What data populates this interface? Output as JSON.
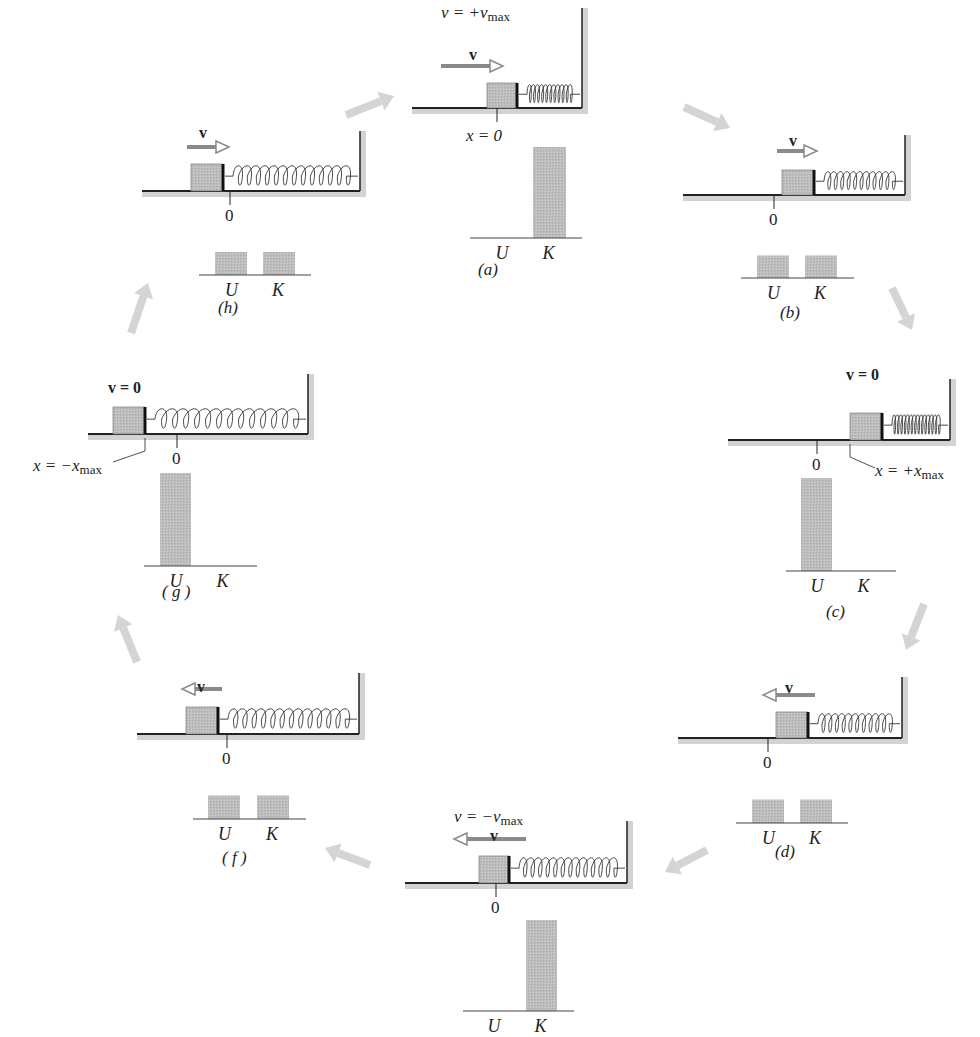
{
  "figure": {
    "colors": {
      "bar": "#b9b9b9",
      "floor": "#d2d2d2",
      "ink": "#222222",
      "cycle_arrow": "#d4d4d4",
      "block": "#c4c4c4",
      "v_arrow": "#8a8a8a"
    }
  },
  "panels": [
    {
      "id": "a",
      "caption": "(a)",
      "velocity_label": "v",
      "velocity_eq": "v = +v",
      "velocity_eq_sub": "max",
      "velocity_dir": "right",
      "position_label": "x = 0",
      "U": 0,
      "K": 1
    },
    {
      "id": "b",
      "caption": "(b)",
      "velocity_label": "v",
      "velocity_dir": "right",
      "zero_label": "0",
      "U": 0.5,
      "K": 0.5
    },
    {
      "id": "c",
      "caption": "(c)",
      "velocity_label": "v = 0",
      "velocity_dir": "none",
      "zero_label": "0",
      "position_label": "x = +x",
      "position_sub": "max",
      "U": 1,
      "K": 0
    },
    {
      "id": "d",
      "caption": "(d)",
      "velocity_label": "v",
      "velocity_dir": "left",
      "zero_label": "0",
      "U": 0.5,
      "K": 0.5
    },
    {
      "id": "e",
      "caption": "",
      "velocity_label": "v",
      "velocity_eq": "v = −v",
      "velocity_eq_sub": "max",
      "velocity_dir": "left",
      "zero_label": "0",
      "U": 0,
      "K": 1
    },
    {
      "id": "f",
      "caption": "( f )",
      "velocity_label": "v",
      "velocity_dir": "left",
      "zero_label": "0",
      "U": 0.5,
      "K": 0.5
    },
    {
      "id": "g",
      "caption": "( g )",
      "velocity_label": "v = 0",
      "velocity_dir": "none",
      "zero_label": "0",
      "position_label": "x = −x",
      "position_sub": "max",
      "U": 1,
      "K": 0
    },
    {
      "id": "h",
      "caption": "(h)",
      "velocity_label": "v",
      "velocity_dir": "right",
      "zero_label": "0",
      "U": 0.5,
      "K": 0.5
    }
  ],
  "bar_labels": {
    "U": "U",
    "K": "K"
  },
  "chart_data": {
    "type": "bar",
    "categories": [
      "U",
      "K"
    ],
    "series": [
      {
        "name": "(a)",
        "values": [
          0,
          1
        ]
      },
      {
        "name": "(b)",
        "values": [
          0.5,
          0.5
        ]
      },
      {
        "name": "(c)",
        "values": [
          1,
          0
        ]
      },
      {
        "name": "(d)",
        "values": [
          0.5,
          0.5
        ]
      },
      {
        "name": "(e)",
        "values": [
          0,
          1
        ]
      },
      {
        "name": "(f)",
        "values": [
          0.5,
          0.5
        ]
      },
      {
        "name": "(g)",
        "values": [
          1,
          0
        ]
      },
      {
        "name": "(h)",
        "values": [
          0.5,
          0.5
        ]
      }
    ],
    "ylabel": "Energy (fraction of total)",
    "ylim": [
      0,
      1
    ],
    "grid": false
  }
}
